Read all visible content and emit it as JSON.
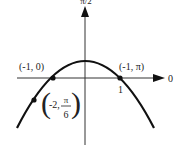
{
  "figure": {
    "axis_top_label": "π/2",
    "axis_right_label": "0",
    "tick_label": "1",
    "points": [
      {
        "label": "(-1, 0)"
      },
      {
        "label": "(-1, π)"
      },
      {
        "label_prefix": "-2,",
        "label_num": "π",
        "label_den": "6"
      }
    ]
  }
}
